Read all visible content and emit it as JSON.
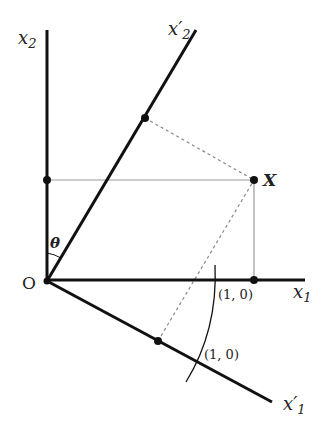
{
  "diagram": {
    "labels": {
      "x2_axis": "x",
      "x2_sub": "2",
      "x2p_axis": "x′",
      "x2p_sub": "2",
      "x1_axis": "x",
      "x1_sub": "1",
      "x1p_axis": "x′",
      "x1p_sub": "1",
      "origin": "O",
      "point": "X",
      "angle": "θ",
      "unit_x1": "(1, 0)",
      "unit_x1p": "(1, 0)"
    },
    "colors": {
      "axis": "#111111",
      "projection_solid": "#999999",
      "projection_dashed": "#888888",
      "point": "#111111"
    }
  }
}
